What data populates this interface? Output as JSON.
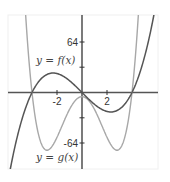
{
  "chart_data": {
    "type": "line",
    "title": "",
    "xlabel": "",
    "ylabel": "",
    "xlim": [
      -5.9,
      6.1
    ],
    "ylim": [
      -98,
      98
    ],
    "grid": false,
    "x_ticks": [
      -2,
      2
    ],
    "x_tick_labels": [
      "-2",
      "2"
    ],
    "y_ticks": [
      -64,
      -32,
      32,
      64
    ],
    "y_tick_labels": [
      "-64",
      "",
      "",
      "64"
    ],
    "series": [
      {
        "name": "y = f(x)",
        "formula": "x^3 - 16x",
        "color": "#555555",
        "x": [
          -5.5,
          -5,
          -4,
          -3,
          -2.31,
          -2,
          -1,
          0,
          1,
          2,
          2.31,
          3,
          4,
          5,
          6
        ],
        "values": [
          -78.4,
          -45,
          0,
          21,
          24.6,
          24,
          15,
          0,
          -15,
          -24,
          -24.6,
          -21,
          0,
          45,
          120
        ]
      },
      {
        "name": "y = g(x)",
        "formula": "1.1(x^2-16)(x^2+0.3)",
        "color": "#a8a8a8",
        "x": [
          -4.6,
          -4,
          -3.5,
          -2.8,
          -2,
          -1,
          0,
          1,
          2,
          2.8,
          3.5,
          4,
          4.6
        ],
        "values": [
          89,
          0,
          -50,
          -73,
          -55,
          -21,
          -5.3,
          -21,
          -55,
          -73,
          -50,
          0,
          89
        ]
      }
    ],
    "annotations": [
      {
        "text": "y = f(x)",
        "x": -4.8,
        "y": 40
      },
      {
        "text": "y = g(x)",
        "x": -4.8,
        "y": -78
      }
    ]
  },
  "labels": {
    "f": "y = f(x)",
    "g": "y = g(x)",
    "xtick_neg2": "-2",
    "xtick_2": "2",
    "ytick_64": "64",
    "ytick_neg64": "-64"
  }
}
